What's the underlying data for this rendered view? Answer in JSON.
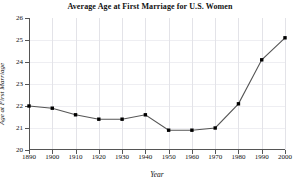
{
  "chart_data": {
    "type": "line",
    "title": "Average Age at First Marriage for U.S. Women",
    "xlabel": "Year",
    "ylabel": "Age at First Marriage",
    "x": [
      1890,
      1900,
      1910,
      1920,
      1930,
      1940,
      1950,
      1960,
      1970,
      1980,
      1990,
      2000
    ],
    "values": [
      22.0,
      21.9,
      21.6,
      21.4,
      21.4,
      21.6,
      20.9,
      20.9,
      21.0,
      22.1,
      24.1,
      25.1
    ],
    "xlim": [
      1890,
      2000
    ],
    "ylim": [
      20,
      26
    ],
    "xticks": [
      1890,
      1900,
      1910,
      1920,
      1930,
      1940,
      1950,
      1960,
      1970,
      1980,
      1990,
      2000
    ],
    "yticks": [
      20,
      21,
      22,
      23,
      24,
      25,
      26
    ],
    "xtick_labels": [
      "1890",
      "1900",
      "1910",
      "1920",
      "1930",
      "1940",
      "1950",
      "1960",
      "1970",
      "1980",
      "1990",
      "2000"
    ],
    "ytick_labels": [
      "20",
      "21",
      "22",
      "23",
      "24",
      "25",
      "26"
    ],
    "grid": true,
    "legend": false,
    "series_color": "#555555",
    "marker_color": "#000000",
    "grid_color": "#e3e3e8",
    "axis_color": "#555555"
  }
}
